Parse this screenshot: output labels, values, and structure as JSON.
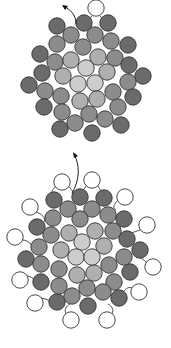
{
  "diagram": {
    "bead_radius": 8.2,
    "colors": {
      "outline": "#333333",
      "dark": "#6b6b6b",
      "mid": "#8c8c8c",
      "light": "#afafaf",
      "lightest": "#cdcdcd",
      "white": "#ffffff",
      "thread": "#222222"
    },
    "panels": [
      {
        "name": "top-bead-cluster",
        "thread_arrow": {
          "path": "M76 24 C 76 14, 70 10, 64 6",
          "head": [
            62,
            5
          ]
        },
        "thread_loops": [
          "M92 16 C 88 20, 88 24, 92 26",
          "M100 16 C 104 20, 104 24, 100 26"
        ],
        "beads": [
          {
            "x": 96,
            "y": 8,
            "t": "white"
          },
          {
            "x": 57,
            "y": 26,
            "t": "dark"
          },
          {
            "x": 84,
            "y": 23,
            "t": "dark"
          },
          {
            "x": 108,
            "y": 23,
            "t": "dark"
          },
          {
            "x": 71,
            "y": 35,
            "t": "mid"
          },
          {
            "x": 95,
            "y": 35,
            "t": "mid"
          },
          {
            "x": 111,
            "y": 41,
            "t": "mid"
          },
          {
            "x": 128,
            "y": 45,
            "t": "dark"
          },
          {
            "x": 57,
            "y": 44,
            "t": "mid"
          },
          {
            "x": 83,
            "y": 47,
            "t": "mid"
          },
          {
            "x": 40,
            "y": 54,
            "t": "dark"
          },
          {
            "x": 55,
            "y": 62,
            "t": "mid"
          },
          {
            "x": 71,
            "y": 60,
            "t": "light"
          },
          {
            "x": 98,
            "y": 57,
            "t": "light"
          },
          {
            "x": 115,
            "y": 58,
            "t": "mid"
          },
          {
            "x": 129,
            "y": 65,
            "t": "dark"
          },
          {
            "x": 143,
            "y": 76,
            "t": "dark"
          },
          {
            "x": 42,
            "y": 73,
            "t": "dark"
          },
          {
            "x": 63,
            "y": 76,
            "t": "light"
          },
          {
            "x": 86,
            "y": 68,
            "t": "lightest"
          },
          {
            "x": 107,
            "y": 72,
            "t": "light"
          },
          {
            "x": 29,
            "y": 85,
            "t": "dark"
          },
          {
            "x": 45,
            "y": 91,
            "t": "mid"
          },
          {
            "x": 78,
            "y": 84,
            "t": "lightest"
          },
          {
            "x": 95,
            "y": 83,
            "t": "lightest"
          },
          {
            "x": 113,
            "y": 92,
            "t": "mid"
          },
          {
            "x": 128,
            "y": 82,
            "t": "mid"
          },
          {
            "x": 133,
            "y": 97,
            "t": "dark"
          },
          {
            "x": 61,
            "y": 96,
            "t": "mid"
          },
          {
            "x": 80,
            "y": 101,
            "t": "light"
          },
          {
            "x": 97,
            "y": 99,
            "t": "light"
          },
          {
            "x": 44,
            "y": 107,
            "t": "dark"
          },
          {
            "x": 62,
            "y": 112,
            "t": "mid"
          },
          {
            "x": 89,
            "y": 114,
            "t": "mid"
          },
          {
            "x": 105,
            "y": 119,
            "t": "mid"
          },
          {
            "x": 118,
            "y": 107,
            "t": "mid"
          },
          {
            "x": 75,
            "y": 123,
            "t": "mid"
          },
          {
            "x": 60,
            "y": 129,
            "t": "dark"
          },
          {
            "x": 92,
            "y": 133,
            "t": "dark"
          },
          {
            "x": 121,
            "y": 125,
            "t": "dark"
          }
        ]
      },
      {
        "name": "bottom-bead-cluster",
        "thread_arrow": {
          "path": "M72 193 C 80 180, 80 165, 74 154",
          "head": [
            73,
            152
          ]
        },
        "thread_loops": [
          "M56 186 C 52 190, 50 194, 54 194",
          "M68 186 C 72 190, 74 192, 72 194",
          "M86 186 C 84 190, 82 192, 80 190",
          "M98 186 C 100 190, 102 192, 104 192",
          "M118 200 C 114 204, 112 208, 116 210",
          "M36 212 C 42 214, 46 218, 44 222",
          "M140 230 C 134 232, 130 234, 128 232",
          "M22 240 C 28 240, 32 244, 34 250",
          "M146 262 C 142 258, 138 256, 136 258",
          "M26 276 C 30 276, 34 278, 36 282",
          "M132 288 C 128 286, 124 290, 122 294",
          "M40 298 C 44 298, 48 300, 52 302",
          "M66 314 C 64 310, 66 306, 70 304",
          "M112 314 C 114 310, 112 306, 108 304"
        ],
        "beads": [
          {
            "x": 62,
            "y": 182,
            "t": "white"
          },
          {
            "x": 92,
            "y": 180,
            "t": "white"
          },
          {
            "x": 125,
            "y": 197,
            "t": "white"
          },
          {
            "x": 30,
            "y": 207,
            "t": "white"
          },
          {
            "x": 147,
            "y": 225,
            "t": "white"
          },
          {
            "x": 15,
            "y": 237,
            "t": "white"
          },
          {
            "x": 153,
            "y": 267,
            "t": "white"
          },
          {
            "x": 20,
            "y": 280,
            "t": "white"
          },
          {
            "x": 139,
            "y": 292,
            "t": "white"
          },
          {
            "x": 35,
            "y": 303,
            "t": "white"
          },
          {
            "x": 71,
            "y": 320,
            "t": "white"
          },
          {
            "x": 107,
            "y": 320,
            "t": "white"
          },
          {
            "x": 54,
            "y": 200,
            "t": "dark"
          },
          {
            "x": 80,
            "y": 197,
            "t": "dark"
          },
          {
            "x": 104,
            "y": 198,
            "t": "dark"
          },
          {
            "x": 124,
            "y": 219,
            "t": "dark"
          },
          {
            "x": 37,
            "y": 227,
            "t": "dark"
          },
          {
            "x": 127,
            "y": 239,
            "t": "dark"
          },
          {
            "x": 140,
            "y": 250,
            "t": "dark"
          },
          {
            "x": 26,
            "y": 259,
            "t": "dark"
          },
          {
            "x": 130,
            "y": 272,
            "t": "dark"
          },
          {
            "x": 41,
            "y": 282,
            "t": "dark"
          },
          {
            "x": 119,
            "y": 298,
            "t": "dark"
          },
          {
            "x": 57,
            "y": 302,
            "t": "dark"
          },
          {
            "x": 88,
            "y": 306,
            "t": "dark"
          },
          {
            "x": 68,
            "y": 209,
            "t": "mid"
          },
          {
            "x": 92,
            "y": 209,
            "t": "mid"
          },
          {
            "x": 108,
            "y": 215,
            "t": "mid"
          },
          {
            "x": 53,
            "y": 218,
            "t": "mid"
          },
          {
            "x": 80,
            "y": 219,
            "t": "mid"
          },
          {
            "x": 113,
            "y": 231,
            "t": "mid"
          },
          {
            "x": 51,
            "y": 235,
            "t": "mid"
          },
          {
            "x": 39,
            "y": 247,
            "t": "mid"
          },
          {
            "x": 124,
            "y": 257,
            "t": "mid"
          },
          {
            "x": 41,
            "y": 264,
            "t": "mid"
          },
          {
            "x": 109,
            "y": 265,
            "t": "mid"
          },
          {
            "x": 59,
            "y": 269,
            "t": "mid"
          },
          {
            "x": 114,
            "y": 282,
            "t": "mid"
          },
          {
            "x": 59,
            "y": 286,
            "t": "mid"
          },
          {
            "x": 87,
            "y": 288,
            "t": "mid"
          },
          {
            "x": 72,
            "y": 296,
            "t": "mid"
          },
          {
            "x": 103,
            "y": 292,
            "t": "mid"
          },
          {
            "x": 69,
            "y": 233,
            "t": "light"
          },
          {
            "x": 95,
            "y": 231,
            "t": "light"
          },
          {
            "x": 61,
            "y": 250,
            "t": "light"
          },
          {
            "x": 104,
            "y": 246,
            "t": "light"
          },
          {
            "x": 77,
            "y": 275,
            "t": "light"
          },
          {
            "x": 94,
            "y": 273,
            "t": "light"
          },
          {
            "x": 82,
            "y": 242,
            "t": "lightest"
          },
          {
            "x": 76,
            "y": 257,
            "t": "lightest"
          },
          {
            "x": 92,
            "y": 257,
            "t": "lightest"
          }
        ]
      }
    ]
  }
}
